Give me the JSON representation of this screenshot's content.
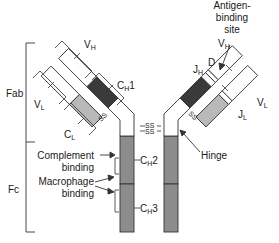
{
  "diagram": {
    "colors": {
      "constant_heavy_ch1": "#3a3a3a",
      "constant_light": "#b9b9b9",
      "fc_region": "#8c8c8c",
      "variable": "#ffffff",
      "outline": "#333333"
    },
    "regions": {
      "fab": "Fab",
      "fc": "Fc"
    },
    "labels": {
      "vh_left": {
        "main": "V",
        "sub": "H"
      },
      "vl_left": {
        "main": "V",
        "sub": "L"
      },
      "ch1_left": {
        "main": "C",
        "sub": "H",
        "suffix": "1"
      },
      "cl_left": {
        "main": "C",
        "sub": "L"
      },
      "vh_right": {
        "main": "V",
        "sub": "H"
      },
      "vl_right": {
        "main": "V",
        "sub": "L"
      },
      "jh_right": {
        "main": "J",
        "sub": "H"
      },
      "d_right": "D",
      "jl_right": {
        "main": "J",
        "sub": "L"
      },
      "ch2": {
        "main": "C",
        "sub": "H",
        "suffix": "2"
      },
      "ch3": {
        "main": "C",
        "sub": "H",
        "suffix": "3"
      },
      "antigen_binding_site": [
        "Antigen-",
        "binding",
        "site"
      ],
      "hinge": "Hinge",
      "complement_binding": [
        "Complement",
        "binding"
      ],
      "macrophage_binding": [
        "Macrophage",
        "binding"
      ],
      "disulfide": "SS"
    }
  }
}
